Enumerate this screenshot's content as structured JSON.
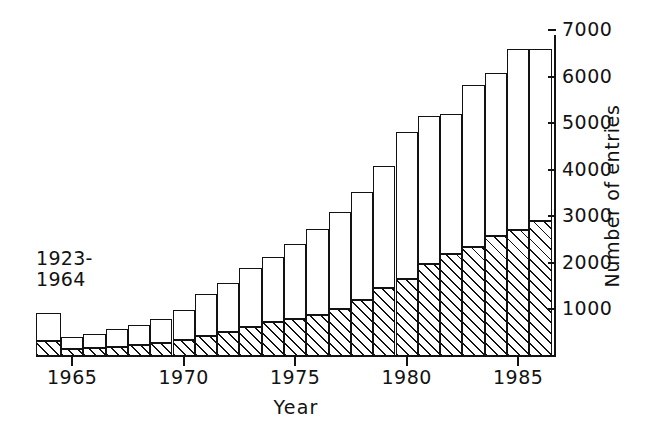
{
  "chart_data": {
    "type": "bar",
    "title": "",
    "xlabel": "Year",
    "ylabel": "Number of entries",
    "ylim": [
      0,
      7000
    ],
    "ytick_values": [
      1000,
      2000,
      3000,
      4000,
      5000,
      6000,
      7000
    ],
    "ytick_labels": [
      "1000",
      "2000",
      "3000",
      "4000",
      "5000",
      "6000",
      "7000"
    ],
    "xtick_values": [
      1965,
      1970,
      1975,
      1980,
      1985
    ],
    "xtick_labels": [
      "1965",
      "1970",
      "1975",
      "1980",
      "1985"
    ],
    "grid": false,
    "legend": "none",
    "stacked": true,
    "annotations": [
      {
        "text": "1923-\n1964",
        "target_category": "1923-1964"
      }
    ],
    "categories": [
      "1923-1964",
      "1965",
      "1966",
      "1967",
      "1968",
      "1969",
      "1970",
      "1971",
      "1972",
      "1973",
      "1974",
      "1975",
      "1976",
      "1977",
      "1978",
      "1979",
      "1980",
      "1981",
      "1982",
      "1983",
      "1984",
      "1985",
      "1986"
    ],
    "series": [
      {
        "name": "hatched-segment",
        "pattern": "diagonal-hatch",
        "values": [
          330,
          150,
          170,
          190,
          230,
          280,
          350,
          430,
          520,
          620,
          720,
          790,
          880,
          1000,
          1200,
          1450,
          1650,
          1980,
          2180,
          2340,
          2580,
          2700,
          2900
        ]
      },
      {
        "name": "white-segment",
        "pattern": "solid-white",
        "values": [
          600,
          250,
          310,
          380,
          440,
          520,
          630,
          900,
          1050,
          1280,
          1400,
          1620,
          1840,
          2100,
          2320,
          2620,
          3150,
          3180,
          3020,
          3470,
          3500,
          3900,
          3700
        ]
      }
    ],
    "totals": [
      930,
      400,
      480,
      570,
      670,
      800,
      980,
      1330,
      1570,
      1900,
      2120,
      2410,
      2720,
      3100,
      3520,
      4070,
      4800,
      5160,
      5200,
      5810,
      6080,
      6600,
      6600
    ]
  }
}
